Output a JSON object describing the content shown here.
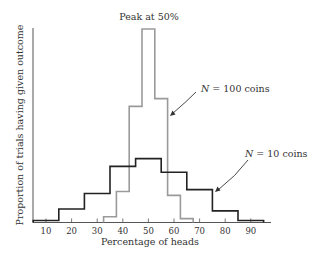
{
  "chart_data": {
    "type": "histogram-step",
    "title": "",
    "xlabel": "Percentage of heads",
    "ylabel": "Proportion of trials having given outcome",
    "x_ticks": [
      10,
      20,
      30,
      40,
      50,
      60,
      70,
      80,
      90
    ],
    "xlim": [
      5,
      95
    ],
    "y_ticks": [],
    "grid": false,
    "y_units": "relative (peak of N=100 = 1.0; no y tick labels shown)",
    "series": [
      {
        "name": "N = 10 coins",
        "color": "#222222",
        "bin_edges": [
          5,
          15,
          25,
          35,
          45,
          55,
          65,
          75,
          85,
          95
        ],
        "values": [
          0.01,
          0.07,
          0.15,
          0.29,
          0.33,
          0.26,
          0.17,
          0.06,
          0.01
        ]
      },
      {
        "name": "N = 100 coins",
        "color": "#9a9a9a",
        "bin_edges": [
          32.5,
          37.5,
          42.5,
          47.5,
          52.5,
          57.5,
          62.5,
          67.5
        ],
        "values": [
          0.03,
          0.16,
          0.6,
          1.0,
          0.64,
          0.14,
          0.02
        ]
      }
    ],
    "annotations": [
      {
        "text": "Peak at 50%",
        "target": "N = 100 coins peak bin",
        "position": "top-center"
      },
      {
        "text_prefix": "N",
        "text_suffix": " = 100 coins",
        "points_to": "N = 100 coins",
        "arrow": true
      },
      {
        "text_prefix": "N",
        "text_suffix": " = 10 coins",
        "points_to": "N = 10 coins",
        "arrow": true
      }
    ]
  },
  "labels": {
    "peak": "Peak at 50%",
    "n100_var": "N",
    "n100_rest": " = 100 coins",
    "n10_var": "N",
    "n10_rest": " = 10 coins",
    "xlabel": "Percentage of heads",
    "ylabel": "Proportion of trials having given outcome"
  }
}
